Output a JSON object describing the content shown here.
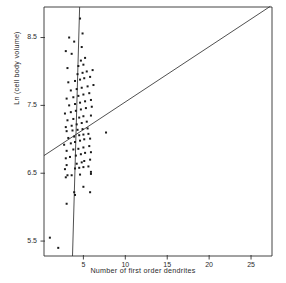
{
  "figure": {
    "background_color": "#ffffff",
    "ink_color": "#303030",
    "marker_color": "#1b1b1b"
  },
  "axes": {
    "frame": {
      "left_px": 44,
      "right_px": 272,
      "top_px": 7,
      "bottom_px": 256
    },
    "x": {
      "title": "Number of first order dendrites",
      "ticks": [
        5,
        10,
        15,
        20,
        25
      ],
      "tick_labels": [
        "5",
        "10",
        "15",
        "20",
        "25"
      ],
      "range": [
        0.3,
        27.5
      ]
    },
    "y": {
      "title": "Ln (cell body volume)",
      "ticks": [
        5.5,
        6.5,
        7.5,
        8.5
      ],
      "tick_labels": [
        "5.5",
        "6.5",
        "7.5",
        "8.5"
      ],
      "range": [
        5.28,
        8.95
      ]
    }
  },
  "chart_data": {
    "type": "scatter",
    "title": "",
    "xlabel": "Number of first order dendrites",
    "ylabel": "Ln (cell body volume)",
    "xlim": [
      0.3,
      27.5
    ],
    "ylim": [
      5.28,
      8.95
    ],
    "xticks": [
      5,
      10,
      15,
      20,
      25
    ],
    "yticks": [
      5.5,
      6.5,
      7.5,
      8.5
    ],
    "grid": false,
    "legend": "none",
    "marker": "small-filled-square",
    "points": [
      [
        2.0,
        5.4
      ],
      [
        1.0,
        5.55
      ],
      [
        3.0,
        6.05
      ],
      [
        4.0,
        6.18
      ],
      [
        3.9,
        6.22
      ],
      [
        5.8,
        6.22
      ],
      [
        5.0,
        6.3
      ],
      [
        2.9,
        6.44
      ],
      [
        3.1,
        6.47
      ],
      [
        3.6,
        6.47
      ],
      [
        4.6,
        6.48
      ],
      [
        5.9,
        6.49
      ],
      [
        5.9,
        6.52
      ],
      [
        2.8,
        6.56
      ],
      [
        4.0,
        6.57
      ],
      [
        4.5,
        6.58
      ],
      [
        5.0,
        6.59
      ],
      [
        5.6,
        6.6
      ],
      [
        3.0,
        6.62
      ],
      [
        4.2,
        6.64
      ],
      [
        4.8,
        6.66
      ],
      [
        5.1,
        6.68
      ],
      [
        5.8,
        6.7
      ],
      [
        2.9,
        6.72
      ],
      [
        3.4,
        6.74
      ],
      [
        4.1,
        6.76
      ],
      [
        4.7,
        6.78
      ],
      [
        5.2,
        6.8
      ],
      [
        5.9,
        6.81
      ],
      [
        3.0,
        6.83
      ],
      [
        3.8,
        6.85
      ],
      [
        4.4,
        6.86
      ],
      [
        5.0,
        6.88
      ],
      [
        5.7,
        6.9
      ],
      [
        2.7,
        6.92
      ],
      [
        3.5,
        6.94
      ],
      [
        4.0,
        6.96
      ],
      [
        4.6,
        6.98
      ],
      [
        5.1,
        7.0
      ],
      [
        5.8,
        7.01
      ],
      [
        3.2,
        7.02
      ],
      [
        3.9,
        7.04
      ],
      [
        4.5,
        7.06
      ],
      [
        5.0,
        7.07
      ],
      [
        5.6,
        7.08
      ],
      [
        7.7,
        7.1
      ],
      [
        3.0,
        7.12
      ],
      [
        3.7,
        7.13
      ],
      [
        4.3,
        7.14
      ],
      [
        4.9,
        7.15
      ],
      [
        5.5,
        7.16
      ],
      [
        2.9,
        7.18
      ],
      [
        3.6,
        7.2
      ],
      [
        4.2,
        7.22
      ],
      [
        4.8,
        7.24
      ],
      [
        5.4,
        7.26
      ],
      [
        3.1,
        7.28
      ],
      [
        3.8,
        7.3
      ],
      [
        4.5,
        7.32
      ],
      [
        5.0,
        7.34
      ],
      [
        5.9,
        7.35
      ],
      [
        2.8,
        7.38
      ],
      [
        3.5,
        7.4
      ],
      [
        4.1,
        7.42
      ],
      [
        4.7,
        7.44
      ],
      [
        5.3,
        7.46
      ],
      [
        6.0,
        7.48
      ],
      [
        3.3,
        7.5
      ],
      [
        4.0,
        7.52
      ],
      [
        4.6,
        7.54
      ],
      [
        5.2,
        7.56
      ],
      [
        5.9,
        7.58
      ],
      [
        3.0,
        7.6
      ],
      [
        3.8,
        7.62
      ],
      [
        4.4,
        7.64
      ],
      [
        5.0,
        7.66
      ],
      [
        5.7,
        7.68
      ],
      [
        3.5,
        7.72
      ],
      [
        4.2,
        7.74
      ],
      [
        4.8,
        7.76
      ],
      [
        5.5,
        7.78
      ],
      [
        6.2,
        7.8
      ],
      [
        3.2,
        7.84
      ],
      [
        4.0,
        7.86
      ],
      [
        4.6,
        7.88
      ],
      [
        5.1,
        7.9
      ],
      [
        5.8,
        7.92
      ],
      [
        4.3,
        7.96
      ],
      [
        4.9,
        7.98
      ],
      [
        5.4,
        8.0
      ],
      [
        6.1,
        8.02
      ],
      [
        3.1,
        8.05
      ],
      [
        4.4,
        8.08
      ],
      [
        5.0,
        8.1
      ],
      [
        4.7,
        8.16
      ],
      [
        5.2,
        8.2
      ],
      [
        3.6,
        8.26
      ],
      [
        2.9,
        8.3
      ],
      [
        4.8,
        8.36
      ],
      [
        3.9,
        8.44
      ],
      [
        3.3,
        8.5
      ],
      [
        4.9,
        8.56
      ],
      [
        4.6,
        8.78
      ]
    ],
    "lines": [
      {
        "name": "regression-line",
        "description": "shallow least-squares regression line",
        "x_start": 0.3,
        "y_start": 6.76,
        "x_end": 27.3,
        "y_end": 8.96
      },
      {
        "name": "major-axis-line",
        "description": "steep near-vertical major axis line",
        "x_start": 4.55,
        "y_start": 8.95,
        "x_end": 3.7,
        "y_end": 5.28
      }
    ]
  }
}
